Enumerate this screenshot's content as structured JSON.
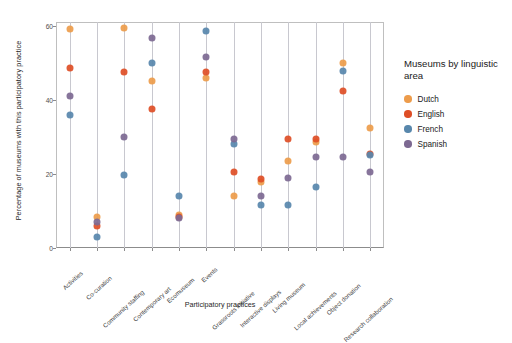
{
  "chart_data": {
    "type": "scatter",
    "title": "",
    "xlabel": "Participatory practices",
    "ylabel": "Percentage of museums with this participatory practice",
    "ylim": [
      0,
      61
    ],
    "yticks": [
      0,
      20,
      40,
      60
    ],
    "grid": "vertical",
    "legend_position": "right",
    "legend_title": "Museums by linguistic area",
    "categories": [
      "Activities",
      "Co-curation",
      "Community staffing",
      "Contemporary art",
      "Ecomuseum",
      "Events",
      "Grassroots initiative",
      "Interactive displays",
      "Living museum",
      "Local achievements",
      "Object donation",
      "Research collaboration"
    ],
    "series": [
      {
        "name": "Dutch",
        "color": "#ED9C4B",
        "values": [
          59.0,
          8.5,
          59.3,
          45.2,
          9.0,
          46.0,
          14.0,
          17.8,
          23.5,
          28.5,
          50.0,
          32.5
        ]
      },
      {
        "name": "English",
        "color": "#DE4E26",
        "values": [
          48.5,
          6.0,
          47.5,
          37.5,
          8.5,
          47.5,
          20.5,
          18.5,
          29.5,
          29.5,
          42.5,
          25.5
        ]
      },
      {
        "name": "French",
        "color": "#5887AC",
        "values": [
          36.0,
          3.0,
          19.8,
          50.0,
          14.0,
          58.5,
          28.0,
          11.5,
          11.5,
          16.5,
          47.8,
          25.0
        ]
      },
      {
        "name": "Spanish",
        "color": "#7D6992",
        "values": [
          41.0,
          7.0,
          30.0,
          56.8,
          8.0,
          51.5,
          29.5,
          14.0,
          19.0,
          24.5,
          24.5,
          20.5
        ]
      }
    ]
  },
  "axis": {
    "ytick_labels": [
      "0",
      "20",
      "40",
      "60"
    ]
  }
}
